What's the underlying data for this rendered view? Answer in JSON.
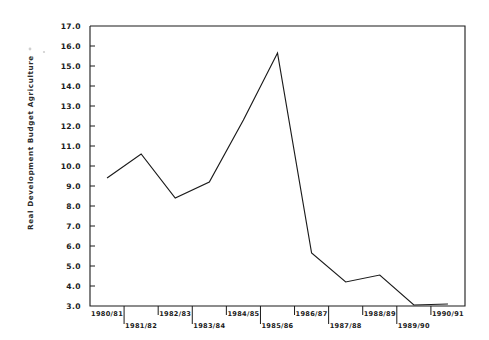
{
  "chart_data": {
    "type": "line",
    "title": "",
    "subtitle": "",
    "xlabel": "",
    "ylabel": "Real Development Budget Agriculture",
    "categories": [
      "1980/81",
      "1981/82",
      "1982/83",
      "1983/84",
      "1984/85",
      "1985/86",
      "1986/87",
      "1987/88",
      "1988/89",
      "1989/90",
      "1990/91"
    ],
    "values": [
      9.4,
      10.6,
      8.4,
      9.2,
      12.3,
      15.65,
      5.65,
      4.2,
      4.55,
      3.05,
      3.1
    ],
    "series": [
      {
        "name": "Real Development Budget Agriculture",
        "values": [
          9.4,
          10.6,
          8.4,
          9.2,
          12.3,
          15.65,
          5.65,
          4.2,
          4.55,
          3.05,
          3.1
        ]
      }
    ],
    "ylim": [
      3.0,
      17.0
    ],
    "xlim": [
      0,
      10
    ],
    "ytick_labels": [
      "17.0",
      "16.0",
      "15.0",
      "14.0",
      "13.0",
      "12.0",
      "11.0",
      "10.0",
      "9.0",
      "8.0",
      "7.0",
      "6.0",
      "5.0",
      "4.0",
      "3.0"
    ],
    "ytick_values": [
      17.0,
      16.0,
      15.0,
      14.0,
      13.0,
      12.0,
      11.0,
      10.0,
      9.0,
      8.0,
      7.0,
      6.0,
      5.0,
      4.0,
      3.0
    ],
    "xtick_labels": [
      "1980/81",
      "1981/82",
      "1982/83",
      "1983/84",
      "1984/85",
      "1985/86",
      "1986/87",
      "1987/88",
      "1988/89",
      "1989/90",
      "1990/91"
    ],
    "grid": false,
    "legend": false,
    "legend_position": "none",
    "line_color": "#1a1a1a",
    "background_color": "#ffffff",
    "annotations": []
  },
  "axes": {
    "y_axis_title": "Real Development Budget Agriculture",
    "y_min_label": "3.0",
    "y_max_label": "17.0"
  }
}
